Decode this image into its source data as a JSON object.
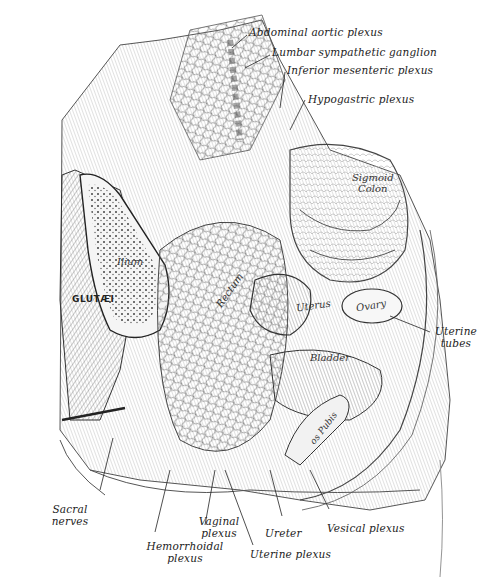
{
  "figure": {
    "type": "anatomical-illustration"
  },
  "labels": {
    "abdominal_aortic_plexus": "Abdominal aortic plexus",
    "lumbar_sympathetic_ganglion": "Lumbar sympathetic ganglion",
    "inferior_mesenteric_plexus": "Inferior mesenteric plexus",
    "hypogastric_plexus": "Hypogastric plexus",
    "uterine_tubes_1": "Uterine",
    "uterine_tubes_2": "tubes",
    "sacral_nerves_1": "Sacral",
    "sacral_nerves_2": "nerves",
    "hemorrhoidal_plexus_1": "Hemorrhoidal",
    "hemorrhoidal_plexus_2": "plexus",
    "vaginal_plexus_1": "Vaginal",
    "vaginal_plexus_2": "plexus",
    "ureter": "Ureter",
    "uterine_plexus": "Uterine plexus",
    "vesical_plexus": "Vesical plexus"
  },
  "inner_labels": {
    "sigmoid_1": "Sigmoid",
    "sigmoid_2": "Colon",
    "ilium": "Ilium",
    "glutaei": "GLUTÆI",
    "rectum": "Rectum",
    "uterus": "Uterus",
    "ovary": "Ovary",
    "bladder": "Bladder",
    "pubis": "os Pubis"
  }
}
